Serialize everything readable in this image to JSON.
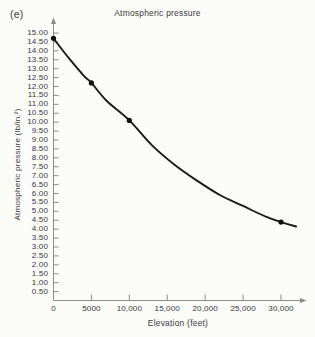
{
  "figure": {
    "panel_label": "(e)",
    "background_color": "#fbfbf8",
    "ink_color": "#39393b"
  },
  "chart_data": {
    "type": "line",
    "title": "Atmospheric pressure",
    "xlabel": "Elevation (feet)",
    "ylabel": "Atmospheric pressure (lb/in.²)",
    "xlim": [
      0,
      33000
    ],
    "ylim": [
      0,
      15.4
    ],
    "grid": false,
    "legend": null,
    "x_tick_labels": [
      "0",
      "5000",
      "10,000",
      "15,000",
      "20,000",
      "25,000",
      "30,000"
    ],
    "x_tick_values": [
      0,
      5000,
      10000,
      15000,
      20000,
      25000,
      30000
    ],
    "y_tick_labels": [
      "15.00",
      "14.50",
      "14.00",
      "13.50",
      "13.00",
      "12.50",
      "12.00",
      "11.50",
      "11.00",
      "10.50",
      "10.00",
      "9.50",
      "9.00",
      "8.50",
      "8.00",
      "7.50",
      "7.00",
      "6.50",
      "6.00",
      "5.50",
      "5.00",
      "4.50",
      "4.00",
      "3.50",
      "3.00",
      "2.50",
      "2.00",
      "1.50",
      "1.00",
      "0.50"
    ],
    "y_tick_values": [
      15.0,
      14.5,
      14.0,
      13.5,
      13.0,
      12.5,
      12.0,
      11.5,
      11.0,
      10.5,
      10.0,
      9.5,
      9.0,
      8.5,
      8.0,
      7.5,
      7.0,
      6.5,
      6.0,
      5.5,
      5.0,
      4.5,
      4.0,
      3.5,
      3.0,
      2.5,
      2.0,
      1.5,
      1.0,
      0.5
    ],
    "origin_label": "0",
    "series": [
      {
        "name": "Atmospheric pressure",
        "x": [
          0,
          5000,
          10000,
          30000
        ],
        "values": [
          14.7,
          12.2,
          10.1,
          4.4
        ],
        "marker": "filled-circle",
        "line_color": "#1a1a1a"
      }
    ],
    "curve_points": {
      "x": [
        0,
        2000,
        4000,
        5000,
        7000,
        10000,
        13000,
        16000,
        19000,
        22000,
        25000,
        28000,
        30000,
        32000
      ],
      "y": [
        14.7,
        13.6,
        12.6,
        12.2,
        11.2,
        10.1,
        8.7,
        7.6,
        6.7,
        5.9,
        5.3,
        4.7,
        4.4,
        4.15
      ]
    }
  }
}
